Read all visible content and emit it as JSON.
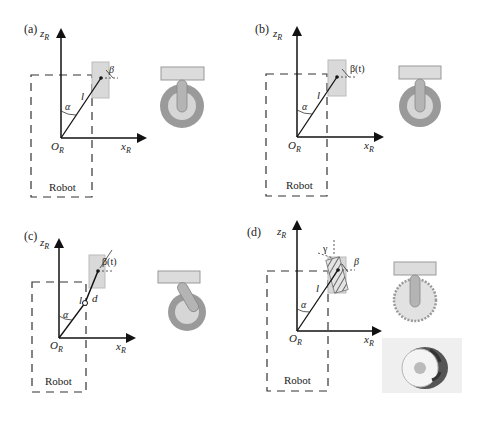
{
  "figure": {
    "panels": [
      {
        "id": "a",
        "label": "(a)",
        "z_axis": "z",
        "z_sub": "R",
        "x_axis": "x",
        "x_sub": "R",
        "origin": "O",
        "origin_sub": "R",
        "length": "l",
        "alpha": "α",
        "beta": "β",
        "body": "Robot",
        "wheel": "fixed standard wheel"
      },
      {
        "id": "b",
        "label": "(b)",
        "z_axis": "z",
        "z_sub": "R",
        "x_axis": "x",
        "x_sub": "R",
        "origin": "O",
        "origin_sub": "R",
        "length": "l",
        "alpha": "α",
        "beta": "β(t)",
        "body": "Robot",
        "wheel": "steered standard wheel"
      },
      {
        "id": "c",
        "label": "(c)",
        "z_axis": "z",
        "z_sub": "R",
        "x_axis": "x",
        "x_sub": "R",
        "origin": "O",
        "origin_sub": "R",
        "length": "l",
        "offset": "d",
        "alpha": "α",
        "beta": "β(t)",
        "body": "Robot",
        "wheel": "castor wheel"
      },
      {
        "id": "d",
        "label": "(d)",
        "z_axis": "z",
        "z_sub": "R",
        "x_axis": "x",
        "x_sub": "R",
        "origin": "O",
        "origin_sub": "R",
        "length": "l",
        "alpha": "α",
        "beta": "β",
        "gamma": "γ",
        "body": "Robot",
        "wheel": "Swedish (mecanum) wheel"
      }
    ],
    "colors": {
      "wheel_outer": "#9a9a9a",
      "wheel_inner": "#d6d6d6",
      "fork": "#b4b4b4",
      "mount": "#dcdcdc",
      "wheel_box": "#d9d9d9",
      "lines": "#111111"
    }
  }
}
